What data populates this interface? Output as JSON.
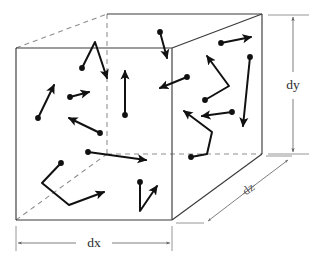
{
  "figure": {
    "type": "kinetic-theory-box-diagram",
    "canvas": {
      "width": 319,
      "height": 263
    },
    "colors": {
      "background": "#ffffff",
      "edge_visible": "#3a3a3a",
      "edge_hidden": "#8d8d8d",
      "vector": "#111111",
      "dimension": "#6f6f6f",
      "label": "#2b2b2b"
    }
  },
  "dimensions": [
    {
      "id": "dx",
      "label": "dx",
      "orientation": "horizontal",
      "label_x": 94,
      "label_y": 243
    },
    {
      "id": "dy",
      "label": "dy",
      "orientation": "vertical",
      "label_x": 293,
      "label_y": 85
    },
    {
      "id": "dz",
      "label": "dz",
      "orientation": "oblique",
      "label_x": 249,
      "label_y": 190,
      "rotation": -36
    }
  ],
  "box": {
    "front_face": {
      "x1": 16,
      "y1": 48,
      "x2": 172,
      "y2": 220
    },
    "back_face": {
      "x1": 107,
      "y1": 14,
      "x2": 262,
      "y2": 154
    },
    "vertices": {
      "front_top_left": [
        16,
        48
      ],
      "front_top_right": [
        172,
        48
      ],
      "front_bottom_left": [
        16,
        220
      ],
      "front_bottom_right": [
        172,
        220
      ],
      "back_top_left": [
        107,
        14
      ],
      "back_top_right": [
        262,
        14
      ],
      "back_bottom_left": [
        107,
        154
      ],
      "back_bottom_right": [
        262,
        154
      ]
    }
  },
  "molecules": [
    {
      "id": "m1",
      "dot": [
        82,
        68
      ],
      "path": "M82,68 L95,42 L107,78",
      "note": "bent path up then down-right"
    },
    {
      "id": "m2",
      "dot": [
        38,
        118
      ],
      "path": "M38,118 L54,85",
      "note": "up-right"
    },
    {
      "id": "m3",
      "dot": [
        70,
        97
      ],
      "path": "M70,97 L89,92",
      "note": "short right"
    },
    {
      "id": "m4",
      "dot": [
        100,
        133
      ],
      "path": "M100,133 L69,118",
      "note": "up-left"
    },
    {
      "id": "m5",
      "dot": [
        125,
        115
      ],
      "path": "M125,115 L125,71",
      "note": "straight up"
    },
    {
      "id": "m6",
      "dot": [
        160,
        32
      ],
      "path": "M160,32 L167,58",
      "note": "down-right short"
    },
    {
      "id": "m7",
      "dot": [
        221,
        43
      ],
      "path": "M221,43 L251,37",
      "note": "right"
    },
    {
      "id": "m8",
      "dot": [
        187,
        77
      ],
      "path": "M187,77 L160,88",
      "note": "down-left"
    },
    {
      "id": "m9",
      "dot": [
        205,
        100
      ],
      "path": "M205,100 L229,86 L207,56",
      "note": "zigzag right-up then up-left"
    },
    {
      "id": "m10",
      "dot": [
        232,
        112
      ],
      "path": "M232,112 L202,116",
      "note": "left"
    },
    {
      "id": "m11",
      "dot": [
        250,
        57
      ],
      "path": "M250,57 L243, 126",
      "note": "down"
    },
    {
      "id": "m12",
      "dot": [
        191,
        157
      ],
      "path": "M191,157 L207,154 L212,132 L184,111",
      "note": "multi-segment up-left"
    },
    {
      "id": "m13",
      "dot": [
        88,
        152
      ],
      "path": "M88,152 L146,160",
      "note": "long right"
    },
    {
      "id": "m14",
      "dot": [
        61,
        163
      ],
      "path": "M61,163 L42,183 L69,205 L104,192",
      "note": "zigzag to up-right"
    },
    {
      "id": "m15",
      "dot": [
        140,
        182
      ],
      "path": "M140,182 L140,211 L157,186",
      "note": "down then up-right"
    }
  ]
}
